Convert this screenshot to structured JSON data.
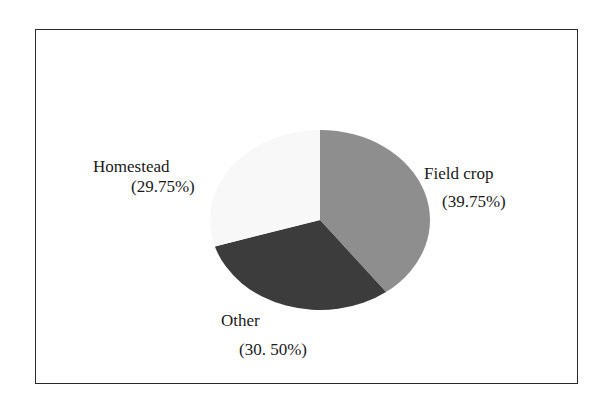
{
  "chart_data": {
    "type": "pie",
    "title": "",
    "slices": [
      {
        "label": "Field crop",
        "value": 39.75,
        "display": "(39.75%)",
        "color": "#8e8e8e"
      },
      {
        "label": "Other",
        "value": 30.5,
        "display": "(30. 50%)",
        "color": "#3c3c3c"
      },
      {
        "label": "Homestead",
        "value": 29.75,
        "display": "(29.75%)",
        "color": "#f8f8f8"
      }
    ],
    "legend": "none",
    "labels_position": "outside"
  },
  "labels": {
    "field_crop_name": "Field crop",
    "field_crop_pct": "(39.75%)",
    "other_name": "Other",
    "other_pct": "(30. 50%)",
    "homestead_name": "Homestead",
    "homestead_pct": "(29.75%)"
  }
}
